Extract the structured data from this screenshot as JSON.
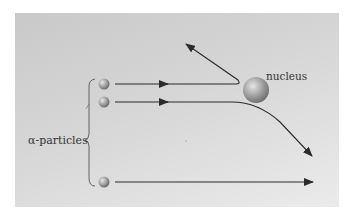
{
  "diagram": {
    "labels": {
      "nucleus": "nucleus",
      "particles": "α-particles"
    },
    "colors": {
      "background_start": "#c9c9c9",
      "background_end": "#ebebeb",
      "line": "#2b2b2b",
      "sphere_light": "#e6e6e6",
      "sphere_dark": "#6e6e6e",
      "text": "#333333"
    },
    "elements": {
      "particles": [
        {
          "id": "particle-top",
          "cx": 104,
          "cy": 84,
          "trajectory": "reflected back"
        },
        {
          "id": "particle-middle",
          "cx": 104,
          "cy": 102,
          "trajectory": "deflected"
        },
        {
          "id": "particle-bottom",
          "cx": 104,
          "cy": 182,
          "trajectory": "undeflected"
        }
      ],
      "nucleus": {
        "cx": 256,
        "cy": 90,
        "r": 13
      }
    }
  }
}
